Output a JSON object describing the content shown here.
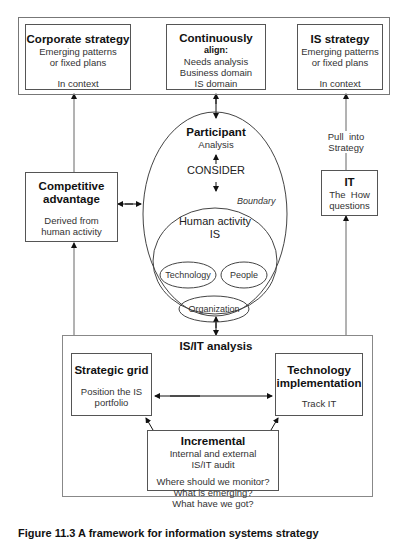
{
  "top_band": {
    "corporate_strategy": {
      "title": "Corporate strategy",
      "line1": "Emerging patterns",
      "line2": "or fixed plans",
      "line3": "In context"
    },
    "continuously_align": {
      "title": "Continuously",
      "subtitle": "align:",
      "line1": "Needs analysis",
      "line2": "Business domain",
      "line3": "IS domain"
    },
    "is_strategy": {
      "title": "IS strategy",
      "line1": "Emerging patterns",
      "line2": "or fixed plans",
      "line3": "In context"
    }
  },
  "competitive_advantage": {
    "title_line1": "Competitive",
    "title_line2": "advantage",
    "line1": "Derived from",
    "line2": "human activity"
  },
  "participant": {
    "title": "Participant",
    "subtitle": "Analysis",
    "consider": "CONSIDER",
    "boundary": "Boundary",
    "human_activity_line1": "Human activity",
    "human_activity_line2": "IS",
    "technology": "Technology",
    "people": "People",
    "organization": "Organization"
  },
  "it": {
    "pull_line1": "Pull  into",
    "pull_line2": "Strategy",
    "title": "IT",
    "line1": "The  How",
    "line2": "questions"
  },
  "isit_analysis": {
    "title": "IS/IT analysis",
    "strategic_grid": {
      "title": "Strategic grid",
      "line1": "Position the IS",
      "line2": "portfolio"
    },
    "technology_implementation": {
      "title_line1": "Technology",
      "title_line2": "implementation",
      "line1": "Track IT"
    },
    "incremental": {
      "title": "Incremental",
      "line1": "Internal and external",
      "line2": "IS/IT audit",
      "line3": "Where should we monitor?",
      "line4": "What is emerging?",
      "line5": "What have we got?"
    }
  },
  "caption": "Figure 11.3  A framework for information systems strategy"
}
